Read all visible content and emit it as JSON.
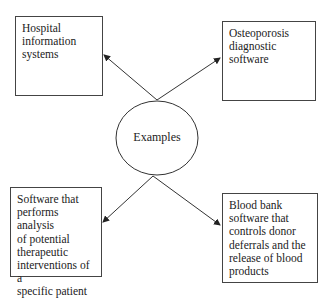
{
  "diagram": {
    "center": {
      "label": "Examples"
    },
    "nodes": [
      {
        "id": "top-left",
        "label": "Hospital information systems",
        "lines": [
          "Hospital",
          "information",
          "systems"
        ]
      },
      {
        "id": "top-right",
        "label": "Osteoporosis diagnostic software",
        "lines": [
          "Osteoporosis",
          "diagnostic",
          "software"
        ]
      },
      {
        "id": "bottom-left",
        "label": "Software that performs analysis of potential therapeutic interventions of a specific patient",
        "lines": [
          "Software that",
          "performs analysis",
          "of potential",
          "therapeutic",
          "interventions of a",
          "specific patient"
        ]
      },
      {
        "id": "bottom-right",
        "label": "Blood bank software that controls donor deferrals and the release of blood products",
        "lines": [
          "Blood bank",
          "software that",
          "controls donor",
          "deferrals and the",
          "release of blood",
          "products"
        ]
      }
    ],
    "edges": [
      {
        "from": "center",
        "to": "top-left",
        "arrow": "end"
      },
      {
        "from": "center",
        "to": "top-right",
        "arrow": "end"
      },
      {
        "from": "center",
        "to": "bottom-left",
        "arrow": "end"
      },
      {
        "from": "center",
        "to": "bottom-right",
        "arrow": "end"
      }
    ]
  }
}
